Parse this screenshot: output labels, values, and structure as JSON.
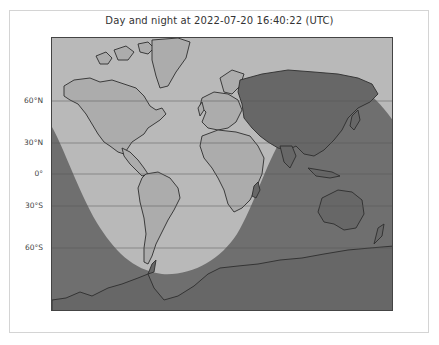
{
  "figure": {
    "title": "Day and night at 2022-07-20 16:40:22 (UTC)"
  },
  "map": {
    "projection": "Mercator",
    "latitude_labels": [
      {
        "label": "60°N",
        "y": 100
      },
      {
        "label": "30°N",
        "y": 142
      },
      {
        "label": "0°",
        "y": 173
      },
      {
        "label": "30°S",
        "y": 205
      },
      {
        "label": "60°S",
        "y": 247
      }
    ],
    "colors": {
      "day": "#b9b9b9",
      "night": "#6f6f6f",
      "land_day": "#acacac",
      "land_night": "#676767",
      "coastline": "#2e2e2e",
      "gridline": "#555555"
    },
    "regions": [
      "day",
      "night"
    ]
  }
}
